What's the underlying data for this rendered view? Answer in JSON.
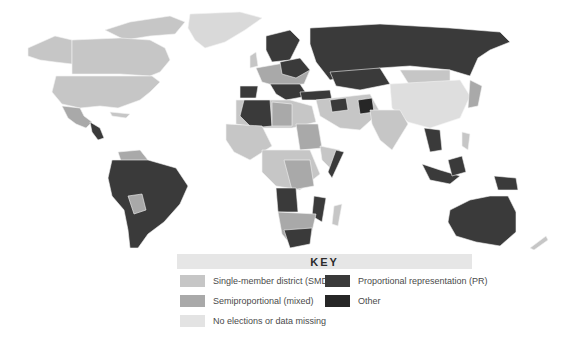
{
  "map": {
    "subject": "World electoral systems",
    "colors": {
      "smd": "#c6c6c6",
      "semi": "#a9a9a9",
      "none": "#e3e3e3",
      "pr": "#3a3a3a",
      "other": "#262626",
      "border": "#f4f4f4"
    }
  },
  "key": {
    "title": "KEY",
    "items": [
      {
        "id": "smd",
        "label": "Single-member district (SMD)",
        "color": "#c6c6c6"
      },
      {
        "id": "pr",
        "label": "Proportional representation (PR)",
        "color": "#3a3a3a"
      },
      {
        "id": "semi",
        "label": "Semiproportional (mixed)",
        "color": "#a9a9a9"
      },
      {
        "id": "other",
        "label": "Other",
        "color": "#262626"
      },
      {
        "id": "none",
        "label": "No elections or data missing",
        "color": "#e3e3e3"
      }
    ]
  }
}
